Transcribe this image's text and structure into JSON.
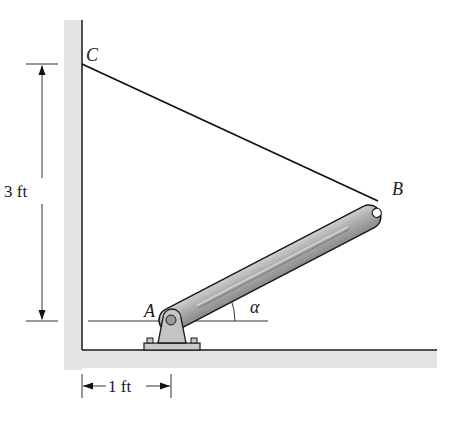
{
  "figure": {
    "points": {
      "A": "A",
      "B": "B",
      "C": "C"
    },
    "angle_label": "α",
    "dimensions": {
      "vertical": "3 ft",
      "horizontal": "1 ft"
    }
  },
  "colors": {
    "wall_fill": "#e6e6e6",
    "line": "#1a1a1a",
    "rod_fill": "#a9a9a9",
    "rod_highlight": "#cfcfcf",
    "support_fill": "#c4c4c4"
  }
}
